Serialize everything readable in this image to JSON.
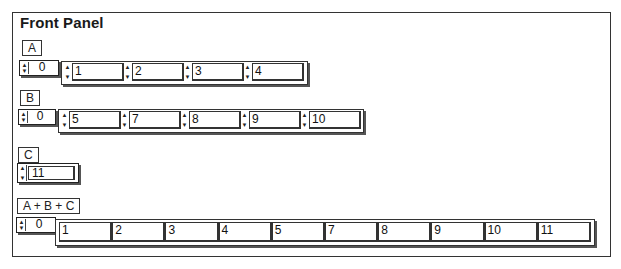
{
  "window": {
    "title": "Front Panel"
  },
  "controls": {
    "A": {
      "label": "A",
      "index": "0",
      "values": [
        "1",
        "2",
        "3",
        "4"
      ]
    },
    "B": {
      "label": "B",
      "index": "0",
      "values": [
        "5",
        "7",
        "8",
        "9",
        "10"
      ]
    },
    "C": {
      "label": "C",
      "value": "11"
    }
  },
  "indicators": {
    "sum": {
      "label": "A + B + C",
      "index": "0",
      "values": [
        "1",
        "2",
        "3",
        "4",
        "5",
        "7",
        "8",
        "9",
        "10",
        "11"
      ]
    }
  },
  "icons": {
    "increment": "▲",
    "decrement": "▼"
  },
  "colors": {
    "border": "#333333",
    "shadow": "#555555",
    "background": "#ffffff"
  }
}
